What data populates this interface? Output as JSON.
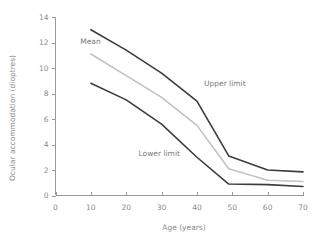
{
  "chart_data": {
    "type": "line",
    "title": "",
    "xlabel": "Age (years)",
    "ylabel": "Ocular accommodation (dioptres)",
    "xlim": [
      0,
      70
    ],
    "ylim": [
      0,
      14
    ],
    "xticks": [
      0,
      10,
      20,
      30,
      40,
      50,
      60,
      70
    ],
    "yticks": [
      0,
      2,
      4,
      6,
      8,
      10,
      12,
      14
    ],
    "xtick_labels": [
      "0",
      "10",
      "20",
      "30",
      "40",
      "50",
      "60",
      "70"
    ],
    "ytick_labels": [
      "0",
      "2",
      "4",
      "6",
      "8",
      "10",
      "12",
      "14"
    ],
    "grid": false,
    "legend_position": "inline-annotations",
    "x": [
      10,
      20,
      30,
      40,
      49,
      60,
      70
    ],
    "series": [
      {
        "name": "Upper limit",
        "color": "#3c3c3c",
        "values": [
          13.0,
          11.4,
          9.6,
          7.4,
          3.1,
          2.0,
          1.85
        ],
        "label_x": 42,
        "label_y": 8.6
      },
      {
        "name": "Mean",
        "color": "#c2c2c2",
        "values": [
          11.1,
          9.4,
          7.7,
          5.5,
          2.1,
          1.2,
          1.1
        ],
        "label_x": 7,
        "label_y": 11.9
      },
      {
        "name": "Lower limit",
        "color": "#3c3c3c",
        "values": [
          8.8,
          7.5,
          5.6,
          3.0,
          0.9,
          0.85,
          0.7
        ],
        "label_x": 23.5,
        "label_y": 3.1
      }
    ]
  },
  "axes": {
    "x_axis_label": "Age (years)",
    "y_axis_label": "Ocular accommodation (dioptres)"
  },
  "annotations": {
    "mean": "Mean",
    "upper_limit": "Upper limit",
    "lower_limit": "Lower limit"
  },
  "colors": {
    "upper_limit": "#3c3c3c",
    "mean": "#c2c2c2",
    "lower_limit": "#3c3c3c",
    "axis": "#9a9a9a",
    "text": "#8a8a8a",
    "background": "#ffffff"
  }
}
